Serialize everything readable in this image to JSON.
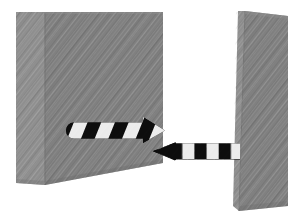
{
  "scene": {
    "title": "Gap clearance between two blocks",
    "canvas": {
      "width": 301,
      "height": 222,
      "background": "#ffffff"
    },
    "palette": {
      "block_face": "#808080",
      "block_side": "#8f8f8f",
      "block_edge": "#6f6f6f",
      "stripe_dark": "#0d0d0d",
      "stripe_light": "#ececec",
      "background": "#ffffff"
    }
  },
  "objects": {
    "left_block": {
      "name": "left block",
      "kind": "extruded-rectangular-slab",
      "face_color": "#808080",
      "side_color": "#8f8f8f",
      "face_points": "45,12 163,12 163,163 45,185",
      "side_points": "16,12 45,12 45,185 16,183",
      "top_edge_y": 12,
      "right_edge_x": 163,
      "bottom_left_y": 185,
      "bottom_right_y": 163
    },
    "right_block": {
      "name": "right block",
      "kind": "extruded-rectangular-slab",
      "face_color": "#808080",
      "side_color": "#8f8f8f",
      "face_points": "245,11 288,16 288,206 239,211",
      "side_points": "238,11 245,11 239,211 233,206",
      "top_y": 11,
      "bottom_y": 211
    },
    "left_arrow": {
      "name": "left hazard arrow",
      "direction": "right",
      "tail_x": 74,
      "tip_x": 163,
      "center_y": 130,
      "thickness": 17,
      "stripe_style": "diagonal",
      "stripe_count": 7,
      "stripe_angle_deg": 22
    },
    "right_arrow": {
      "name": "right hazard arrow",
      "direction": "left",
      "tip_x": 155,
      "tail_x": 240,
      "center_y": 151,
      "thickness": 16,
      "stripe_style": "vertical",
      "stripe_count": 7
    }
  },
  "labels": {
    "left_block": "",
    "right_block": "",
    "gap": "",
    "left_arrow": "",
    "right_arrow": ""
  }
}
